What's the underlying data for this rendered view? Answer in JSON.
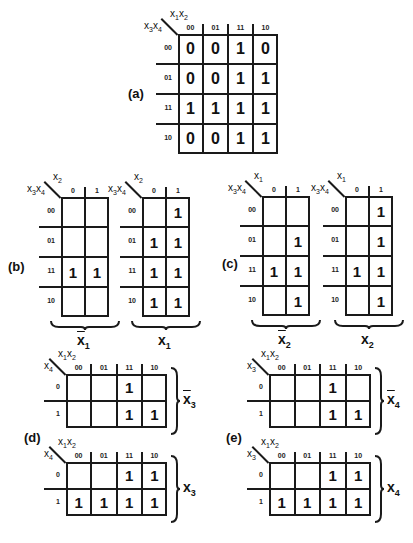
{
  "panels": {
    "a": {
      "label": "(a)",
      "col_var": "x1x2",
      "row_var": "x3x4",
      "cols": [
        "00",
        "01",
        "11",
        "10"
      ],
      "rows": [
        "00",
        "01",
        "11",
        "10"
      ],
      "cells": [
        [
          "0",
          "0",
          "1",
          "0"
        ],
        [
          "0",
          "0",
          "1",
          "1"
        ],
        [
          "1",
          "1",
          "1",
          "1"
        ],
        [
          "0",
          "0",
          "1",
          "1"
        ]
      ]
    },
    "b": {
      "label": "(b)",
      "maps": [
        {
          "col_var": "x2",
          "row_var": "x3x4",
          "cols": [
            "0",
            "1"
          ],
          "rows": [
            "00",
            "01",
            "11",
            "10"
          ],
          "cells": [
            [
              "",
              ""
            ],
            [
              "",
              ""
            ],
            [
              "1",
              "1"
            ],
            [
              "",
              ""
            ]
          ],
          "brace_label": "x̄1",
          "brace_var": "x",
          "brace_sub": "1",
          "negated": true
        },
        {
          "col_var": "x2",
          "row_var": "x3x4",
          "cols": [
            "0",
            "1"
          ],
          "rows": [
            "00",
            "01",
            "11",
            "10"
          ],
          "cells": [
            [
              "",
              "1"
            ],
            [
              "1",
              "1"
            ],
            [
              "1",
              "1"
            ],
            [
              "1",
              "1"
            ]
          ],
          "brace_label": "x1",
          "brace_var": "x",
          "brace_sub": "1",
          "negated": false
        }
      ]
    },
    "c": {
      "label": "(c)",
      "maps": [
        {
          "col_var": "x1",
          "row_var": "x3x4",
          "cols": [
            "0",
            "1"
          ],
          "rows": [
            "00",
            "01",
            "11",
            "10"
          ],
          "cells": [
            [
              "",
              ""
            ],
            [
              "",
              "1"
            ],
            [
              "1",
              "1"
            ],
            [
              "",
              "1"
            ]
          ],
          "brace_label": "x̄2",
          "brace_var": "x",
          "brace_sub": "2",
          "negated": true
        },
        {
          "col_var": "x1",
          "row_var": "x3x4",
          "cols": [
            "0",
            "1"
          ],
          "rows": [
            "00",
            "01",
            "11",
            "10"
          ],
          "cells": [
            [
              "",
              "1"
            ],
            [
              "",
              "1"
            ],
            [
              "1",
              "1"
            ],
            [
              "",
              "1"
            ]
          ],
          "brace_label": "x2",
          "brace_var": "x",
          "brace_sub": "2",
          "negated": false
        }
      ]
    },
    "d": {
      "label": "(d)",
      "maps": [
        {
          "col_var": "x1x2",
          "row_var": "x4",
          "cols": [
            "00",
            "01",
            "11",
            "10"
          ],
          "rows": [
            "0",
            "1"
          ],
          "cells": [
            [
              "",
              "",
              "1",
              ""
            ],
            [
              "",
              "",
              "1",
              "1"
            ]
          ],
          "brace_label": "x̄3",
          "brace_var": "x",
          "brace_sub": "3",
          "negated": true
        },
        {
          "col_var": "x1x2",
          "row_var": "x4",
          "cols": [
            "00",
            "01",
            "11",
            "10"
          ],
          "rows": [
            "0",
            "1"
          ],
          "cells": [
            [
              "",
              "",
              "1",
              "1"
            ],
            [
              "1",
              "1",
              "1",
              "1"
            ]
          ],
          "brace_label": "x3",
          "brace_var": "x",
          "brace_sub": "3",
          "negated": false
        }
      ]
    },
    "e": {
      "label": "(e)",
      "maps": [
        {
          "col_var": "x1x2",
          "row_var": "x3",
          "cols": [
            "00",
            "01",
            "11",
            "10"
          ],
          "rows": [
            "0",
            "1"
          ],
          "cells": [
            [
              "",
              "",
              "1",
              ""
            ],
            [
              "",
              "",
              "1",
              "1"
            ]
          ],
          "brace_label": "x̄4",
          "brace_var": "x",
          "brace_sub": "4",
          "negated": true
        },
        {
          "col_var": "x1x2",
          "row_var": "x3",
          "cols": [
            "00",
            "01",
            "11",
            "10"
          ],
          "rows": [
            "0",
            "1"
          ],
          "cells": [
            [
              "",
              "",
              "1",
              "1"
            ],
            [
              "1",
              "1",
              "1",
              "1"
            ]
          ],
          "brace_label": "x4",
          "brace_var": "x",
          "brace_sub": "4",
          "negated": false
        }
      ]
    }
  }
}
